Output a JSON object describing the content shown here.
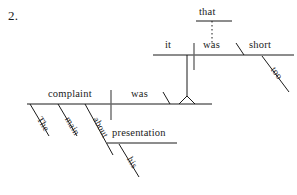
{
  "exercise": {
    "number": "2."
  },
  "diagram": {
    "type": "reed-kellogg-sentence-diagram",
    "sentence": "The main complaint was about his presentation that it was too short",
    "ink_color": "#1b1b1b",
    "background_color": "#ffffff",
    "main_clause": {
      "subject": "complaint",
      "verb": "was",
      "subject_modifiers": [
        "The",
        "main"
      ],
      "preposition": "about",
      "prepositional_object": "presentation",
      "object_modifier": "his"
    },
    "subordinate_clause": {
      "subject": "it",
      "verb": "was",
      "predicate_adjective": "short",
      "adjective_modifier": "too",
      "connector": "that"
    },
    "words": {
      "that": "that",
      "it": "it",
      "was_upper": "was",
      "short": "short",
      "too": "too",
      "the": "The",
      "main": "main",
      "complaint": "complaint",
      "was_lower": "was",
      "about": "about",
      "presentation": "presentation",
      "his": "his"
    }
  }
}
